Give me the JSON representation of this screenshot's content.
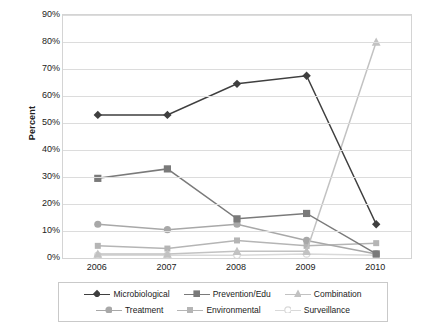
{
  "chart_data": {
    "type": "line",
    "title": "",
    "xlabel": "",
    "ylabel": "Percent",
    "categories": [
      "2006",
      "2007",
      "2008",
      "2009",
      "2010"
    ],
    "ylim": [
      0,
      90
    ],
    "ytick_labels": [
      "0%",
      "10%",
      "20%",
      "30%",
      "40%",
      "50%",
      "60%",
      "70%",
      "80%",
      "90%"
    ],
    "ytick_values": [
      0,
      10,
      20,
      30,
      40,
      50,
      60,
      70,
      80,
      90
    ],
    "grid": true,
    "legend_position": "bottom",
    "series": [
      {
        "name": "Microbiological",
        "color": "#3f3f3f",
        "marker": "diamond",
        "values": [
          53,
          53,
          64.5,
          67.5,
          12.5
        ]
      },
      {
        "name": "Prevention/Edu",
        "color": "#7a7a7a",
        "marker": "square",
        "values": [
          29.5,
          33,
          14.5,
          16.5,
          1.5
        ]
      },
      {
        "name": "Combination",
        "color": "#c2c2c2",
        "marker": "triangle",
        "values": [
          1.5,
          1.5,
          2.5,
          2.5,
          80
        ]
      },
      {
        "name": "Treatment",
        "color": "#a8a8a8",
        "marker": "circle",
        "values": [
          12.5,
          10.5,
          12.5,
          6.5,
          1.5
        ]
      },
      {
        "name": "Environmental",
        "color": "#b5b5b5",
        "marker": "square-small",
        "values": [
          4.5,
          3.5,
          6.5,
          4.5,
          5.5
        ]
      },
      {
        "name": "Surveillance",
        "color": "#d9d9d9",
        "marker": "circle-open",
        "values": [
          1.0,
          1.0,
          1.0,
          1.5,
          1.0
        ]
      }
    ]
  },
  "axis": {
    "y_title": "Percent"
  }
}
